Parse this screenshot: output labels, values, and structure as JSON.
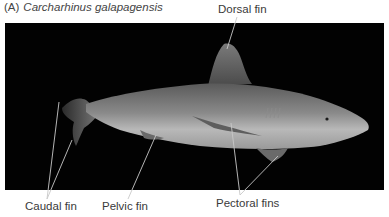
{
  "figure": {
    "panel_letter": "(A)",
    "species": "Carcharhinus galapagensis",
    "background_color": "#020202",
    "leader_line_color": "#c8c8c8"
  },
  "labels": {
    "dorsal_fin": "Dorsal fin",
    "caudal_fin": "Caudal fin",
    "pelvic_fin": "Pelvic fin",
    "pectoral_fins": "Pectoral fins"
  }
}
